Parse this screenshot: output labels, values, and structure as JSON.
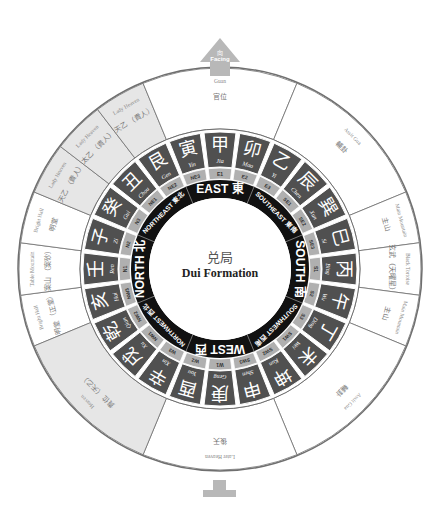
{
  "center": {
    "chinese": "兑局",
    "english": "Dui Formation"
  },
  "facing": {
    "chinese": "向",
    "english": "Facing"
  },
  "colors": {
    "dark_ring": "#505050",
    "black_ring": "#111111",
    "sub_ring": "#b0b0b0",
    "shaded_sector": "#e6e6e6",
    "line": "#6f6f6f",
    "arrow": "#b8b8b8"
  },
  "directions": [
    {
      "label": "EAST",
      "chinese": "東",
      "angle": 0
    },
    {
      "label": "SOUTHEAST",
      "chinese": "東南",
      "angle": 45
    },
    {
      "label": "SOUTH",
      "chinese": "南",
      "angle": 90
    },
    {
      "label": "SOUTHWEST",
      "chinese": "西南",
      "angle": 135
    },
    {
      "label": "WEST",
      "chinese": "西",
      "angle": 180
    },
    {
      "label": "NORTHWEST",
      "chinese": "西北",
      "angle": 225
    },
    {
      "label": "NORTH",
      "chinese": "北",
      "angle": 270
    },
    {
      "label": "NORTHEAST",
      "chinese": "東北",
      "angle": 315
    }
  ],
  "mountains": [
    {
      "code": "E1",
      "chinese": "甲",
      "pinyin": "Jia"
    },
    {
      "code": "E2",
      "chinese": "卯",
      "pinyin": "Mao"
    },
    {
      "code": "E3",
      "chinese": "乙",
      "pinyin": "Yi"
    },
    {
      "code": "SE1",
      "chinese": "辰",
      "pinyin": "Chen"
    },
    {
      "code": "SE2",
      "chinese": "巽",
      "pinyin": "Xun"
    },
    {
      "code": "SE3",
      "chinese": "巳",
      "pinyin": "Si"
    },
    {
      "code": "S1",
      "chinese": "丙",
      "pinyin": "Bing"
    },
    {
      "code": "S2",
      "chinese": "午",
      "pinyin": "Wu"
    },
    {
      "code": "S3",
      "chinese": "丁",
      "pinyin": "Ding"
    },
    {
      "code": "SW1",
      "chinese": "未",
      "pinyin": "Wei"
    },
    {
      "code": "SW2",
      "chinese": "坤",
      "pinyin": "Kun"
    },
    {
      "code": "SW3",
      "chinese": "申",
      "pinyin": "Shen"
    },
    {
      "code": "W1",
      "chinese": "庚",
      "pinyin": "Geng"
    },
    {
      "code": "W2",
      "chinese": "酉",
      "pinyin": "You"
    },
    {
      "code": "W3",
      "chinese": "辛",
      "pinyin": "Xin"
    },
    {
      "code": "NW1",
      "chinese": "戌",
      "pinyin": "Xu"
    },
    {
      "code": "NW2",
      "chinese": "乾",
      "pinyin": "Qian"
    },
    {
      "code": "NW3",
      "chinese": "亥",
      "pinyin": "Hai"
    },
    {
      "code": "N1",
      "chinese": "壬",
      "pinyin": "Ren"
    },
    {
      "code": "N2",
      "chinese": "子",
      "pinyin": "Zi"
    },
    {
      "code": "N3",
      "chinese": "癸",
      "pinyin": "Gui"
    },
    {
      "code": "NE1",
      "chinese": "丑",
      "pinyin": "Chou"
    },
    {
      "code": "NE2",
      "chinese": "艮",
      "pinyin": "Gen"
    },
    {
      "code": "NE3",
      "chinese": "寅",
      "pinyin": "Yin"
    }
  ],
  "outer_sectors": [
    {
      "chinese": "明堂",
      "sub": "（正堂）",
      "english": "Bright Hall",
      "note": "(Direct Point)",
      "start": 247.5,
      "end": 262.5,
      "shaded": false
    },
    {
      "chinese": "案山",
      "sub": "（案砂）",
      "english": "Table Mountain",
      "note": "(Table Mountain Kohers)",
      "start": 262.5,
      "end": 277.5,
      "shaded": false
    },
    {
      "chinese": "明堂",
      "sub": "",
      "english": "Bright Hall",
      "note": "",
      "start": 277.5,
      "end": 292.5,
      "shaded": false
    },
    {
      "chinese": "天乙",
      "sub": "（貴人）",
      "english": "Lady Heaven",
      "note": "(Lady Nobleman)",
      "start": 292.5,
      "end": 307.5,
      "shaded": true
    },
    {
      "chinese": "太乙",
      "sub": "（貴人）",
      "english": "Lady Heaven",
      "note": "(Lady Nobleman)",
      "start": 307.5,
      "end": 322.5,
      "shaded": true
    },
    {
      "chinese": "天乙",
      "sub": "（貴人）",
      "english": "Lady Heaven",
      "note": "(Lady Nobleman)",
      "start": 322.5,
      "end": 337.5,
      "shaded": true
    },
    {
      "chinese": "官位",
      "sub": "",
      "english": "Guan",
      "note": "",
      "start": 337.5,
      "end": 22.5,
      "shaded": false
    },
    {
      "chinese": "輔卦",
      "sub": "",
      "english": "Assit Gua",
      "note": "",
      "start": 22.5,
      "end": 67.5,
      "shaded": false
    },
    {
      "chinese": "主山",
      "sub": "",
      "english": "Main Mountain",
      "note": "",
      "start": 67.5,
      "end": 82.5,
      "shaded": false
    },
    {
      "chinese": "玄武",
      "sub": "（天曜星）",
      "english": "Black Tortoise",
      "note": "(Heavenly Kelhap)",
      "start": 82.5,
      "end": 97.5,
      "shaded": false
    },
    {
      "chinese": "主山",
      "sub": "",
      "english": "Main Mountain",
      "note": "",
      "start": 97.5,
      "end": 112.5,
      "shaded": false
    },
    {
      "chinese": "輔卦",
      "sub": "",
      "english": "Assit Gua",
      "note": "",
      "start": 112.5,
      "end": 157.5,
      "shaded": false
    },
    {
      "chinese": "後天",
      "sub": "",
      "english": "Later Heaven",
      "note": "",
      "start": 157.5,
      "end": 202.5,
      "shaded": false
    },
    {
      "chinese": "貴位",
      "sub": "（天乙）",
      "english": "Heaven",
      "note": "(Heaven Nobleman)",
      "start": 202.5,
      "end": 247.5,
      "shaded": true
    }
  ]
}
